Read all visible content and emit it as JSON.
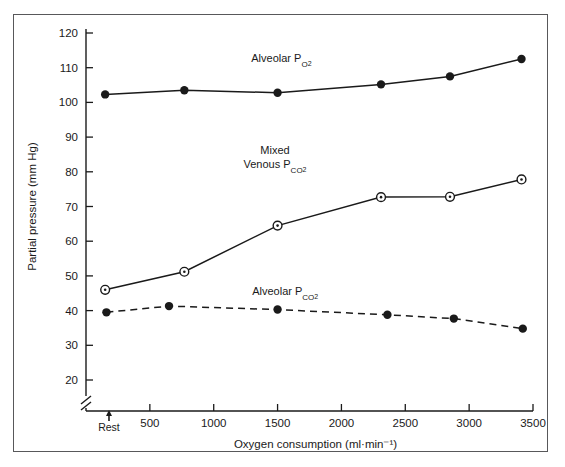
{
  "figure": {
    "background": "#ffffff",
    "frame_color": "#58585a",
    "ink_color": "#1a1a1a"
  },
  "axes": {
    "y_title": "Partial pressure  (mm Hg)",
    "x_title_main": "Oxygen consumption (ml",
    "x_title_mid": "·",
    "x_title_unit": "min",
    "x_title_exp": "−1",
    "x_title_close": ")",
    "x_title_full": "Oxygen consumption (ml·min⁻¹)",
    "y_ticks": [
      20,
      30,
      40,
      50,
      60,
      70,
      80,
      90,
      100,
      110,
      120
    ],
    "x_ticks": [
      500,
      1000,
      1500,
      2000,
      2500,
      3000,
      3500
    ],
    "rest_label": "Rest",
    "axis_break": true
  },
  "chart_data": {
    "type": "line",
    "title": "",
    "xlabel": "Oxygen consumption (ml·min⁻¹)",
    "ylabel": "Partial pressure  (mm Hg)",
    "xlim": [
      0,
      3500
    ],
    "ylim": [
      15,
      120
    ],
    "grid": false,
    "legend": "inline-annotations",
    "series": [
      {
        "name": "Alveolar Po2",
        "label": "Alveolar P",
        "label_sub": "o",
        "label_sub2": "2",
        "label_display": "Alveolar Po₂",
        "marker": "filled-circle",
        "line": "solid",
        "color": "#1a1a1a",
        "label_x": 1530,
        "label_y": 111.5,
        "x": [
          150,
          770,
          1500,
          2310,
          2850,
          3410
        ],
        "y": [
          102.3,
          103.5,
          102.8,
          105.2,
          107.5,
          112.5
        ]
      },
      {
        "name": "Mixed Venous Pco2",
        "label_line1": "Mixed",
        "label_line2": "Venous Pco₂",
        "label_display": "Mixed Venous Pco₂",
        "marker": "open-circle-dot",
        "line": "solid",
        "color": "#1a1a1a",
        "label_x": 1480,
        "label_y": 85,
        "x": [
          150,
          770,
          1500,
          2310,
          2850,
          3410
        ],
        "y": [
          46.0,
          51.2,
          64.5,
          72.7,
          72.8,
          77.8
        ]
      },
      {
        "name": "Alveolar Pco2",
        "label_display": "Alveolar Pco₂",
        "marker": "filled-circle",
        "line": "dashed",
        "color": "#1a1a1a",
        "label_x": 1560,
        "label_y": 44.5,
        "x": [
          160,
          650,
          1500,
          2360,
          2880,
          3420
        ],
        "y": [
          39.5,
          41.3,
          40.3,
          38.8,
          37.7,
          34.8
        ]
      }
    ]
  }
}
